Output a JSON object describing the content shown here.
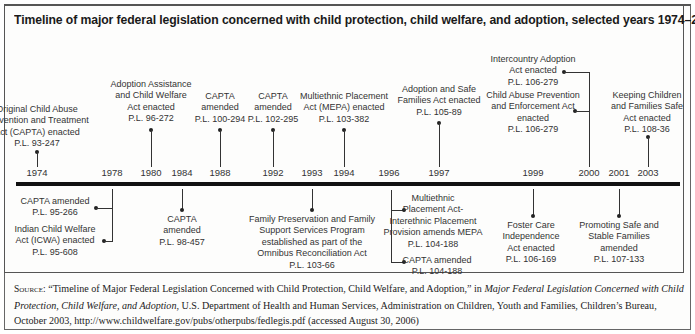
{
  "title": "Timeline of major federal legislation concerned with child protection, child welfare, and adoption, selected years 1974–2003",
  "years": [
    {
      "label": "1974",
      "x": 37
    },
    {
      "label": "1978",
      "x": 112
    },
    {
      "label": "1980",
      "x": 151
    },
    {
      "label": "1984",
      "x": 182
    },
    {
      "label": "1988",
      "x": 220
    },
    {
      "label": "1992",
      "x": 273
    },
    {
      "label": "1993",
      "x": 312
    },
    {
      "label": "1994",
      "x": 344
    },
    {
      "label": "1996",
      "x": 389
    },
    {
      "label": "1997",
      "x": 439
    },
    {
      "label": "1999",
      "x": 533
    },
    {
      "label": "2000",
      "x": 589
    },
    {
      "label": "2001",
      "x": 619
    },
    {
      "label": "2003",
      "x": 648
    }
  ],
  "above": [
    {
      "year": "1974",
      "lines": [
        "Original Child Abuse",
        "Prevention and Treatment",
        "Act (CAPTA) enacted",
        "P.L. 93-247"
      ]
    },
    {
      "year": "1980",
      "lines": [
        "Adoption Assistance",
        "and Child Welfare",
        "Act enacted",
        "P.L. 96-272"
      ]
    },
    {
      "year": "1988",
      "lines": [
        "CAPTA",
        "amended",
        "P.L. 100-294"
      ]
    },
    {
      "year": "1992",
      "lines": [
        "CAPTA",
        "amended",
        "P.L. 102-295"
      ]
    },
    {
      "year": "1994",
      "lines": [
        "Multiethnic Placement",
        "Act (MEPA) enacted",
        "P.L. 103-382"
      ]
    },
    {
      "year": "1997",
      "lines": [
        "Adoption and Safe",
        "Families Act enacted",
        "P.L. 105-89"
      ]
    },
    {
      "year": "2000a",
      "lines": [
        "Intercountry Adoption",
        "Act enacted",
        "P.L. 106-279"
      ]
    },
    {
      "year": "2000b",
      "lines": [
        "Child Abuse Prevention",
        "and Enforcement Act",
        "enacted",
        "P.L. 106-279"
      ]
    },
    {
      "year": "2003",
      "lines": [
        "Keeping Children",
        "and Families Safe",
        "Act enacted",
        "P.L. 108-36"
      ]
    }
  ],
  "below": [
    {
      "year": "1978a",
      "lines": [
        "CAPTA amended",
        "P.L. 95-266"
      ]
    },
    {
      "year": "1978b",
      "lines": [
        "Indian Child Welfare",
        "Act (ICWA) enacted",
        "P.L. 95-608"
      ]
    },
    {
      "year": "1984",
      "lines": [
        "CAPTA",
        "amended",
        "P.L. 98-457"
      ]
    },
    {
      "year": "1993",
      "lines": [
        "Family Preservation and Family",
        "Support Services Program",
        "established as part of the",
        "Omnibus Reconciliation Act",
        "P.L. 103-66"
      ]
    },
    {
      "year": "1996a",
      "lines": [
        "Multiethnic",
        "Placement Act-",
        "Interethnic Placement",
        "Provision amends MEPA",
        "P.L. 104-188"
      ]
    },
    {
      "year": "1996b",
      "lines": [
        "CAPTA amended",
        "P.L. 104-188"
      ]
    },
    {
      "year": "1999",
      "lines": [
        "Foster Care",
        "Independence",
        "Act enacted",
        "P.L. 106-169"
      ]
    },
    {
      "year": "2001",
      "lines": [
        "Promoting Safe and",
        "Stable Families",
        "amended",
        "P.L. 107-133"
      ]
    }
  ],
  "source": {
    "label": "Source:",
    "part1": " “Timeline of Major Federal Legislation Concerned with Child Protection, Child Welfare, and Adoption,” in ",
    "italic": "Major Federal Legislation Concerned with Child Protection, Child Welfare, and Adoption",
    "part2": ", U.S. Department of Health and Human Services, Administration on Children, Youth and Families, Children’s Bureau, October 2003, http://www.childwelfare.gov/pubs/otherpubs/fedlegis.pdf (accessed August 30, 2006)"
  },
  "chart_data": {
    "type": "timeline",
    "title": "Timeline of major federal legislation concerned with child protection, child welfare, and adoption, selected years 1974–2003",
    "events": [
      {
        "year": 1974,
        "event": "Original Child Abuse Prevention and Treatment Act (CAPTA) enacted",
        "law": "P.L. 93-247"
      },
      {
        "year": 1978,
        "event": "CAPTA amended",
        "law": "P.L. 95-266"
      },
      {
        "year": 1978,
        "event": "Indian Child Welfare Act (ICWA) enacted",
        "law": "P.L. 95-608"
      },
      {
        "year": 1980,
        "event": "Adoption Assistance and Child Welfare Act enacted",
        "law": "P.L. 96-272"
      },
      {
        "year": 1984,
        "event": "CAPTA amended",
        "law": "P.L. 98-457"
      },
      {
        "year": 1988,
        "event": "CAPTA amended",
        "law": "P.L. 100-294"
      },
      {
        "year": 1992,
        "event": "CAPTA amended",
        "law": "P.L. 102-295"
      },
      {
        "year": 1993,
        "event": "Family Preservation and Family Support Services Program established as part of the Omnibus Reconciliation Act",
        "law": "P.L. 103-66"
      },
      {
        "year": 1994,
        "event": "Multiethnic Placement Act (MEPA) enacted",
        "law": "P.L. 103-382"
      },
      {
        "year": 1996,
        "event": "Multiethnic Placement Act-Interethnic Placement Provision amends MEPA",
        "law": "P.L. 104-188"
      },
      {
        "year": 1996,
        "event": "CAPTA amended",
        "law": "P.L. 104-188"
      },
      {
        "year": 1997,
        "event": "Adoption and Safe Families Act enacted",
        "law": "P.L. 105-89"
      },
      {
        "year": 1999,
        "event": "Foster Care Independence Act enacted",
        "law": "P.L. 106-169"
      },
      {
        "year": 2000,
        "event": "Intercountry Adoption Act enacted",
        "law": "P.L. 106-279"
      },
      {
        "year": 2000,
        "event": "Child Abuse Prevention and Enforcement Act enacted",
        "law": "P.L. 106-279"
      },
      {
        "year": 2001,
        "event": "Promoting Safe and Stable Families amended",
        "law": "P.L. 107-133"
      },
      {
        "year": 2003,
        "event": "Keeping Children and Families Safe Act enacted",
        "law": "P.L. 108-36"
      }
    ]
  }
}
